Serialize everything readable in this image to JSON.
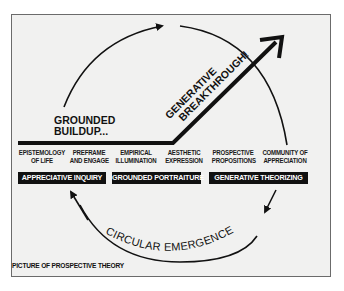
{
  "diagram": {
    "title_caption": "PICTURE OF PROSPECTIVE THEORY",
    "grounded_buildup": [
      "GROUNDED",
      "BUILDUP..."
    ],
    "generative_breakthrough": [
      "GENERATIVE",
      "BREAKTHROUGH!"
    ],
    "circular_emergence": "CIRCULAR EMERGENCE",
    "stages": [
      {
        "line1": "EPISTEMOLOGY",
        "line2": "OF LIFE"
      },
      {
        "line1": "PREFRAME",
        "line2": "AND ENGAGE"
      },
      {
        "line1": "EMPIRICAL",
        "line2": "ILLUMINATION"
      },
      {
        "line1": "AESTHETIC",
        "line2": "EXPRESSION"
      },
      {
        "line1": "PROSPECTIVE",
        "line2": "PROPOSITIONS"
      },
      {
        "line1": "COMMUNITY OF",
        "line2": "APPRECIATION"
      }
    ],
    "phases": [
      {
        "label": "APPRECIATIVE INQUIRY"
      },
      {
        "label": "GROUNDED PORTRAITURE"
      },
      {
        "label": "GENERATIVE THEORIZING"
      }
    ],
    "colors": {
      "background": "#f1f1f0",
      "frame_border": "#6b6b6b",
      "ink": "#111111",
      "phase_text": "#ffffff"
    }
  }
}
